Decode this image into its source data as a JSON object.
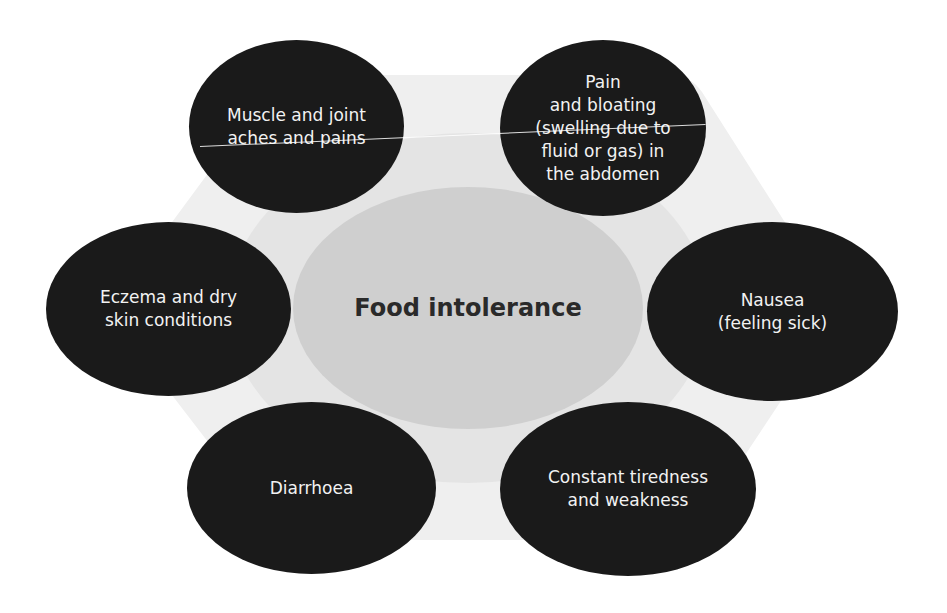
{
  "diagram": {
    "title": "Food intolerance",
    "colors": {
      "outer_hexagon": "#efefef",
      "inner_band": "#e4e4e4",
      "center": "#cfcfcf",
      "symptom_node": "#1a1a1a",
      "symptom_text": "#f2f2f2",
      "center_text": "#2a2a2a"
    },
    "symptoms": [
      {
        "id": "muscle",
        "position": "top-left",
        "label": "Muscle and joint\naches and pains"
      },
      {
        "id": "bloating",
        "position": "top-right",
        "label": "Pain\nand bloating\n(swelling due to\nfluid or gas) in\nthe abdomen"
      },
      {
        "id": "eczema",
        "position": "left",
        "label": "Eczema and dry\nskin conditions"
      },
      {
        "id": "nausea",
        "position": "right",
        "label": "Nausea\n(feeling sick)"
      },
      {
        "id": "diarrhoea",
        "position": "bottom-left",
        "label": "Diarrhoea"
      },
      {
        "id": "tiredness",
        "position": "bottom-right",
        "label": "Constant tiredness\nand weakness"
      }
    ]
  }
}
